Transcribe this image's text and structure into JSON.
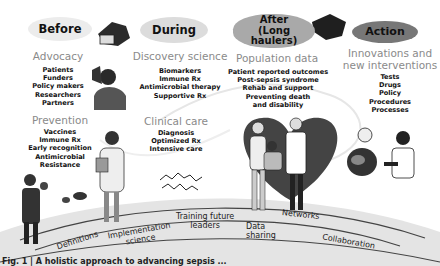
{
  "phases": [
    {
      "label": "Before",
      "fill": "#ececec"
    },
    {
      "label": "During",
      "fill": "#dcdcdc"
    },
    {
      "label": "After\n(Long haulers)",
      "line1": "After",
      "line2": "(Long haulers)",
      "fill": "#a9a9a9"
    },
    {
      "label": "Action",
      "fill": "#777777"
    }
  ],
  "sections": {
    "advocacy": {
      "title": "Advocacy",
      "items": [
        "Patients",
        "Funders",
        "Policy makers",
        "Researchers",
        "Partners"
      ]
    },
    "prevention": {
      "title": "Prevention",
      "items": [
        "Vaccines",
        "Immune Rx",
        "Early recognition",
        "Antimicrobial",
        "Resistance"
      ]
    },
    "discovery": {
      "title": "Discovery science",
      "items": [
        "Biomarkers",
        "Immune Rx",
        "Antimicrobial therapy",
        "Supportive Rx"
      ]
    },
    "clinical": {
      "title": "Clinical care",
      "items": [
        "Diagnosis",
        "Optimized Rx",
        "Intensive care"
      ]
    },
    "population": {
      "title": "Population data",
      "items": [
        "Patient reported outcomes",
        "Post-sepsis syndrome",
        "Rehab and support",
        "Preventing death",
        "and disability"
      ]
    },
    "innovations": {
      "title_line1": "Innovations and",
      "title_line2": "new interventions",
      "items": [
        "Tests",
        "Drugs",
        "Policy",
        "Procedures",
        "Processes"
      ]
    }
  },
  "foundation": {
    "labels": [
      "Definitions",
      "Implementation\nscience",
      "Training future\nleaders",
      "Data\nsharing",
      "Networks",
      "Collaboration"
    ],
    "definitions": "Definitions",
    "implementation_1": "Implementation",
    "implementation_2": "science",
    "training_1": "Training future",
    "training_2": "leaders",
    "data_1": "Data",
    "data_2": "sharing",
    "networks": "Networks",
    "collaboration": "Collaboration"
  },
  "caption": "Fig. 1 | A holistic approach to advancing sepsis ...",
  "colors": {
    "earth": "#d9d9d9",
    "earth_band": "#bcbcbc",
    "heart": "#444444",
    "title_gray": "#8a8a8a"
  }
}
